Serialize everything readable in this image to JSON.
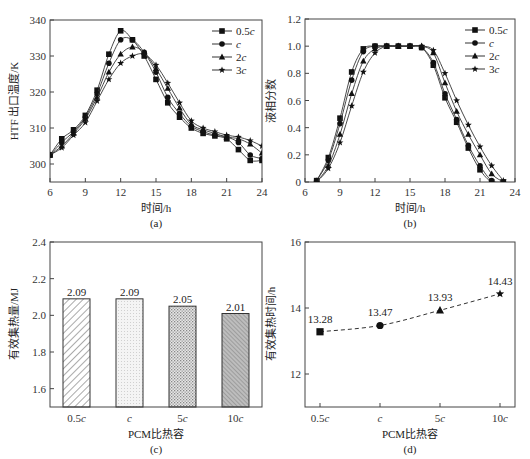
{
  "chart_data": [
    {
      "id": "a",
      "type": "line",
      "caption": "(a)",
      "xlabel": "时间/h",
      "ylabel": "HTF 出口温度/K",
      "xlim": [
        6,
        24
      ],
      "ylim": [
        295,
        340
      ],
      "xticks": [
        6,
        9,
        12,
        15,
        18,
        21,
        24
      ],
      "yticks": [
        300,
        310,
        320,
        330,
        340
      ],
      "legend_position": "upper right",
      "x": [
        6,
        7,
        8,
        9,
        10,
        11,
        12,
        13,
        14,
        15,
        16,
        17,
        18,
        19,
        20,
        21,
        22,
        23,
        24
      ],
      "series": [
        {
          "name": "0.5c",
          "marker": "square",
          "values": [
            302.5,
            307,
            309.5,
            313.5,
            320.5,
            330.5,
            337,
            334.5,
            330,
            323.5,
            317,
            313,
            310,
            308.5,
            307.8,
            307,
            304,
            301,
            301
          ]
        },
        {
          "name": "c",
          "marker": "circle",
          "values": [
            302.5,
            306,
            309,
            313,
            319.5,
            328,
            334.5,
            334.5,
            331,
            325.5,
            318.5,
            314,
            310.5,
            309,
            308,
            307.5,
            306,
            302.5,
            301.5
          ]
        },
        {
          "name": "2c",
          "marker": "triangle",
          "values": [
            302.5,
            305,
            308.5,
            312.5,
            318.5,
            325.5,
            330.5,
            332.5,
            331,
            326.5,
            321,
            315.5,
            311,
            309.5,
            308.5,
            307.5,
            307,
            305.5,
            303
          ]
        },
        {
          "name": "3c",
          "marker": "star",
          "values": [
            302.5,
            304.5,
            308,
            311.5,
            317.5,
            323.5,
            328,
            330,
            330.5,
            327.5,
            322.5,
            317,
            312,
            310,
            309,
            308,
            307.5,
            306.5,
            305
          ]
        }
      ]
    },
    {
      "id": "b",
      "type": "line",
      "caption": "(b)",
      "xlabel": "时间/h",
      "ylabel": "液相分数",
      "xlim": [
        6,
        24
      ],
      "ylim": [
        0,
        1.2
      ],
      "xticks": [
        6,
        9,
        12,
        15,
        18,
        21,
        24
      ],
      "yticks": [
        0,
        0.2,
        0.4,
        0.6,
        0.8,
        1.0,
        1.2
      ],
      "ytick_labels": [
        "0",
        "0.2",
        "0.4",
        "0.6",
        "0.8",
        "1.0",
        "1.2"
      ],
      "legend_position": "upper right",
      "x": [
        7,
        8,
        9,
        10,
        11,
        12,
        13,
        14,
        15,
        16,
        17,
        18,
        19,
        20,
        21,
        22,
        23
      ],
      "series": [
        {
          "name": "0.5c",
          "marker": "square",
          "values": [
            0.01,
            0.18,
            0.47,
            0.81,
            0.98,
            1.0,
            1.0,
            1.0,
            1.0,
            0.99,
            0.86,
            0.62,
            0.44,
            0.25,
            0.09,
            0,
            0
          ]
        },
        {
          "name": "c",
          "marker": "circle",
          "values": [
            0.01,
            0.16,
            0.43,
            0.75,
            0.96,
            1.0,
            1.0,
            1.0,
            1.0,
            0.99,
            0.88,
            0.65,
            0.46,
            0.27,
            0.12,
            0.01,
            0
          ]
        },
        {
          "name": "2c",
          "marker": "triangle",
          "values": [
            0,
            0.12,
            0.35,
            0.65,
            0.89,
            0.98,
            1.0,
            1.0,
            1.0,
            1.0,
            0.95,
            0.73,
            0.52,
            0.35,
            0.2,
            0.06,
            0
          ]
        },
        {
          "name": "3c",
          "marker": "star",
          "values": [
            0,
            0.1,
            0.29,
            0.56,
            0.81,
            0.95,
            1.0,
            1.0,
            1.0,
            1.0,
            0.97,
            0.8,
            0.6,
            0.42,
            0.26,
            0.12,
            0.01
          ]
        }
      ]
    },
    {
      "id": "c",
      "type": "bar",
      "caption": "(c)",
      "xlabel": "PCM比热容",
      "ylabel": "有效集热量/MJ",
      "ylim": [
        1.5,
        2.4
      ],
      "yticks": [
        1.6,
        1.8,
        2.0,
        2.2,
        2.4
      ],
      "ytick_labels": [
        "1.6",
        "1.8",
        "2.0",
        "2.2",
        "2.4"
      ],
      "categories": [
        "0.5c",
        "c",
        "5c",
        "10c"
      ],
      "values": [
        2.09,
        2.09,
        2.05,
        2.01
      ],
      "value_labels": [
        "2.09",
        "2.09",
        "2.05",
        "2.01"
      ],
      "patterns": [
        "diagonal-hatch",
        "fine-dots",
        "cross-dots",
        "dense-backslash"
      ]
    },
    {
      "id": "d",
      "type": "line",
      "caption": "(d)",
      "xlabel": "PCM比热容",
      "ylabel": "有效集热时间/h",
      "ylim": [
        11,
        16
      ],
      "yticks": [
        12,
        14,
        16
      ],
      "categories": [
        "0.5c",
        "c",
        "5c",
        "10c"
      ],
      "values": [
        13.28,
        13.47,
        13.93,
        14.43
      ],
      "value_labels": [
        "13.28",
        "13.47",
        "13.93",
        "14.43"
      ],
      "markers": [
        "square",
        "circle",
        "triangle",
        "star"
      ],
      "line_style": "dashed"
    }
  ]
}
